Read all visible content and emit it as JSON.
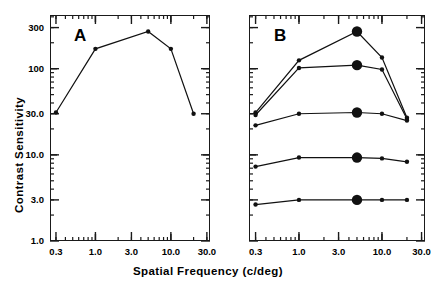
{
  "figure": {
    "axis_title_x": "Spatial Frequency (c/deg)",
    "axis_title_y": "Contrast Sensitivity",
    "panel_a_letter": "A",
    "panel_b_letter": "B"
  },
  "axes": {
    "x_tick_labels": [
      "0.3",
      "1.0",
      "3.0",
      "10.0",
      "30.0"
    ],
    "x_tick_values": [
      0.3,
      1.0,
      3.0,
      10.0,
      30.0
    ],
    "y_tick_labels": [
      "1.0",
      "3.0",
      "10.0",
      "30.0",
      "100",
      "300"
    ],
    "y_tick_values": [
      1.0,
      3.0,
      10.0,
      30.0,
      100,
      300
    ],
    "xlim": [
      0.25,
      33
    ],
    "ylim": [
      1.0,
      420
    ],
    "xscale": "log",
    "yscale": "log"
  },
  "chart_data": [
    {
      "type": "line",
      "panel": "A",
      "title": "A",
      "xlabel": "Spatial Frequency (c/deg)",
      "ylabel": "Contrast Sensitivity",
      "xscale": "log",
      "yscale": "log",
      "xlim": [
        0.25,
        33
      ],
      "ylim": [
        1.0,
        420
      ],
      "grid": false,
      "legend": "none",
      "series": [
        {
          "name": "contrast sensitivity function",
          "marker": "filled-circle",
          "x": [
            0.3,
            1.0,
            5.0,
            10.0,
            20.0
          ],
          "y": [
            31,
            170,
            270,
            170,
            30
          ]
        }
      ]
    },
    {
      "type": "line",
      "panel": "B",
      "title": "B",
      "xlabel": "Spatial Frequency (c/deg)",
      "ylabel": "Contrast Sensitivity",
      "xscale": "log",
      "yscale": "log",
      "xlim": [
        0.25,
        33
      ],
      "ylim": [
        1.0,
        420
      ],
      "grid": false,
      "legend": "none",
      "series": [
        {
          "name": "curve 1 (highest)",
          "marker": "filled-circle",
          "highlight_x": 5.0,
          "x": [
            0.3,
            1.0,
            5.0,
            10.0,
            20.0
          ],
          "y": [
            31,
            125,
            270,
            135,
            27
          ]
        },
        {
          "name": "curve 2",
          "marker": "filled-circle",
          "highlight_x": 5.0,
          "x": [
            0.3,
            1.0,
            5.0,
            10.0,
            20.0
          ],
          "y": [
            29,
            102,
            110,
            98,
            26
          ]
        },
        {
          "name": "curve 3",
          "marker": "filled-circle",
          "highlight_x": 5.0,
          "x": [
            0.3,
            1.0,
            5.0,
            10.0,
            20.0
          ],
          "y": [
            22,
            30,
            31,
            30,
            25
          ]
        },
        {
          "name": "curve 4",
          "marker": "filled-circle",
          "highlight_x": 5.0,
          "x": [
            0.3,
            1.0,
            5.0,
            10.0,
            20.0
          ],
          "y": [
            7.3,
            9.3,
            9.3,
            9.1,
            8.3
          ]
        },
        {
          "name": "curve 5 (lowest)",
          "marker": "filled-circle",
          "highlight_x": 5.0,
          "x": [
            0.3,
            1.0,
            5.0,
            10.0,
            20.0
          ],
          "y": [
            2.65,
            3.0,
            3.0,
            3.0,
            3.0
          ]
        }
      ]
    }
  ]
}
